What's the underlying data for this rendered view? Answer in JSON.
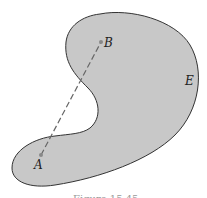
{
  "figure": {
    "region_label": "E",
    "point_a_label": "A",
    "point_b_label": "B",
    "caption": "Figure 15.45",
    "colors": {
      "region_fill": "#c8c8c8",
      "outline": "#333333",
      "segment": "#666666",
      "points": "#888888"
    }
  }
}
